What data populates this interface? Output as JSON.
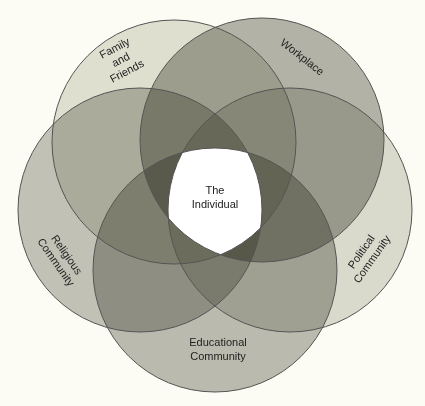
{
  "center": {
    "label_line1": "The",
    "label_line2": "Individual",
    "color": "#ffffff"
  },
  "circles": [
    {
      "id": "family",
      "lines": [
        "Family",
        "and",
        "Friends"
      ],
      "cx": 174,
      "cy": 142,
      "r": 122,
      "fill": "#e2e2da"
    },
    {
      "id": "workplace",
      "lines": [
        "Workplace"
      ],
      "cx": 262,
      "cy": 140,
      "r": 122,
      "fill": "#b4b4ae"
    },
    {
      "id": "religious",
      "lines": [
        "Religious",
        "Community"
      ],
      "cx": 140,
      "cy": 210,
      "r": 122,
      "fill": "#c4c4be"
    },
    {
      "id": "political",
      "lines": [
        "Political",
        "Community"
      ],
      "cx": 290,
      "cy": 210,
      "r": 122,
      "fill": "#dcdcd6"
    },
    {
      "id": "educational",
      "lines": [
        "Educational",
        "Community"
      ],
      "cx": 215,
      "cy": 270,
      "r": 122,
      "fill": "#bcbcb6"
    }
  ],
  "stroke_color": "#555555",
  "background": "#fcfcf4"
}
